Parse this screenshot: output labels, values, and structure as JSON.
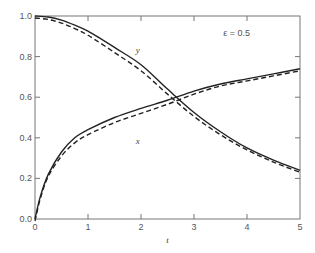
{
  "chart_data": {
    "type": "line",
    "title": "",
    "xlabel": "t",
    "ylabel": "",
    "xlim": [
      0,
      5
    ],
    "ylim": [
      0,
      1.0
    ],
    "xticks": [
      "0",
      "1",
      "2",
      "3",
      "4",
      "5"
    ],
    "yticks": [
      "0.0",
      "0.2",
      "0.4",
      "0.6",
      "0.8",
      "1.0"
    ],
    "grid": false,
    "legend": null,
    "annotations": [
      {
        "text": "ε  = 0.5",
        "x": 3.55,
        "y": 0.9
      },
      {
        "text": "y",
        "x": 1.9,
        "y": 0.82
      },
      {
        "text": "x",
        "x": 1.9,
        "y": 0.37
      }
    ],
    "series": [
      {
        "name": "y (exact)",
        "style": "solid",
        "x": [
          0,
          0.25,
          0.5,
          0.75,
          1,
          1.5,
          2,
          2.5,
          3,
          3.5,
          4,
          4.5,
          5
        ],
        "values": [
          1.0,
          0.995,
          0.98,
          0.955,
          0.925,
          0.845,
          0.76,
          0.64,
          0.525,
          0.43,
          0.35,
          0.29,
          0.24
        ]
      },
      {
        "name": "y (approx)",
        "style": "dashed",
        "x": [
          0,
          0.25,
          0.5,
          0.75,
          1,
          1.5,
          2,
          2.5,
          3,
          3.5,
          4,
          4.5,
          5
        ],
        "values": [
          1.0,
          0.993,
          0.975,
          0.948,
          0.915,
          0.83,
          0.74,
          0.625,
          0.515,
          0.425,
          0.35,
          0.29,
          0.24
        ]
      },
      {
        "name": "x (exact)",
        "style": "solid",
        "x": [
          0,
          0.1,
          0.25,
          0.5,
          0.75,
          1,
          1.5,
          2,
          2.5,
          3,
          3.5,
          4,
          4.5,
          5
        ],
        "values": [
          0.0,
          0.11,
          0.22,
          0.33,
          0.4,
          0.44,
          0.5,
          0.545,
          0.585,
          0.63,
          0.665,
          0.69,
          0.715,
          0.74
        ]
      },
      {
        "name": "x (approx)",
        "style": "dashed",
        "x": [
          0,
          0.1,
          0.25,
          0.5,
          0.75,
          1,
          1.5,
          2,
          2.5,
          3,
          3.5,
          4,
          4.5,
          5
        ],
        "values": [
          0.0,
          0.11,
          0.22,
          0.32,
          0.385,
          0.425,
          0.485,
          0.53,
          0.575,
          0.625,
          0.665,
          0.69,
          0.715,
          0.74
        ]
      }
    ]
  }
}
